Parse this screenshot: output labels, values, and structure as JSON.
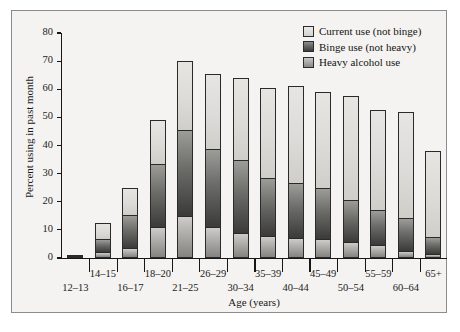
{
  "chart_data": {
    "type": "bar",
    "subtype": "stacked-bar",
    "title": "",
    "xlabel": "Age (years)",
    "ylabel": "Percent using in past month",
    "ylim": [
      0,
      80
    ],
    "yticks": [
      0,
      10,
      20,
      30,
      40,
      50,
      60,
      70,
      80
    ],
    "grid": false,
    "legend_position": "top-right",
    "categories": [
      "12–13",
      "14–15",
      "16–17",
      "18–20",
      "21–25",
      "26–29",
      "30–34",
      "35–39",
      "40–44",
      "45–49",
      "50–54",
      "55–59",
      "60–64",
      "65+"
    ],
    "series": [
      {
        "name": "Heavy alcohol use",
        "color": "#a8a7a3",
        "values": [
          0.4,
          2.2,
          3.4,
          11.2,
          15.1,
          11.2,
          9.0,
          7.7,
          7.2,
          6.7,
          5.7,
          4.8,
          2.6,
          1.3
        ]
      },
      {
        "name": "Binge use (not heavy)",
        "color": "#555552",
        "values": [
          0.2,
          4.5,
          12.0,
          22.2,
          30.4,
          27.6,
          25.8,
          20.9,
          19.4,
          18.3,
          15.0,
          12.1,
          11.5,
          6.2
        ]
      },
      {
        "name": "Current use (not binge)",
        "color": "#dcdbd7",
        "values": [
          0.2,
          5.8,
          9.4,
          15.7,
          24.5,
          26.5,
          29.2,
          32.0,
          34.5,
          34.0,
          36.9,
          35.9,
          37.7,
          30.7
        ]
      }
    ],
    "totals": [
      0.8,
      12.5,
      24.8,
      49.1,
      70.0,
      65.3,
      63.9,
      60.6,
      61.1,
      59.0,
      57.6,
      52.8,
      51.8,
      38.2
    ]
  },
  "legend": {
    "items": [
      {
        "label": "Current use (not binge)",
        "swatch_class": "sw-current"
      },
      {
        "label": "Binge use (not heavy)",
        "swatch_class": "sw-binge"
      },
      {
        "label": "Heavy alcohol use",
        "swatch_class": "sw-heavy"
      }
    ]
  },
  "axes": {
    "y_title": "Percent using in past month",
    "x_title": "Age (years)"
  }
}
